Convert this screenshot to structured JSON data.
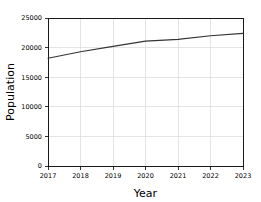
{
  "chart_data": {
    "type": "line",
    "title": "",
    "xlabel": "Year",
    "ylabel": "Population",
    "x": [
      2017,
      2018,
      2019,
      2020,
      2021,
      2022,
      2023
    ],
    "xtick_labels": [
      "2017",
      "2018",
      "2019",
      "2020",
      "2021",
      "2022",
      "2023"
    ],
    "ytick_labels": [
      "0",
      "5000",
      "10000",
      "15000",
      "20000",
      "25000"
    ],
    "ytick_values": [
      0,
      5000,
      10000,
      15000,
      20000,
      25000
    ],
    "series": [
      {
        "name": "Population",
        "values": [
          18200,
          19300,
          20200,
          21100,
          21400,
          22000,
          22400
        ],
        "color": "#333333"
      }
    ],
    "xlim": [
      2017,
      2023
    ],
    "ylim": [
      0,
      25000
    ],
    "grid": true,
    "grid_color": "#d8d8d8",
    "legend": "none",
    "background": "#ffffff"
  }
}
